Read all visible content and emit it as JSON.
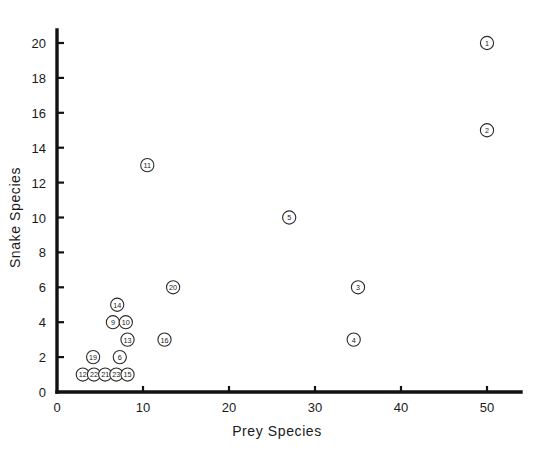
{
  "chart_data": {
    "type": "scatter",
    "title": "",
    "xlabel": "Prey Species",
    "ylabel": "Snake Species",
    "xlim": [
      0,
      55
    ],
    "ylim": [
      0,
      21
    ],
    "xticks": [
      0,
      10,
      20,
      30,
      40,
      50
    ],
    "yticks": [
      0,
      2,
      4,
      6,
      8,
      10,
      12,
      14,
      16,
      18,
      20
    ],
    "grid": false,
    "legend": "none",
    "marker": "open-circle-with-number",
    "points": [
      {
        "label": "1",
        "x": 50.0,
        "y": 20.0
      },
      {
        "label": "2",
        "x": 50.0,
        "y": 15.0
      },
      {
        "label": "11",
        "x": 10.5,
        "y": 13.0
      },
      {
        "label": "5",
        "x": 27.0,
        "y": 10.0
      },
      {
        "label": "20",
        "x": 13.5,
        "y": 6.0
      },
      {
        "label": "3",
        "x": 35.0,
        "y": 6.0
      },
      {
        "label": "14",
        "x": 7.0,
        "y": 5.0
      },
      {
        "label": "9",
        "x": 6.5,
        "y": 4.0
      },
      {
        "label": "10",
        "x": 8.0,
        "y": 4.0
      },
      {
        "label": "13",
        "x": 8.2,
        "y": 3.0
      },
      {
        "label": "16",
        "x": 12.5,
        "y": 3.0
      },
      {
        "label": "4",
        "x": 34.5,
        "y": 3.0
      },
      {
        "label": "19",
        "x": 4.2,
        "y": 2.0
      },
      {
        "label": "6",
        "x": 7.3,
        "y": 2.0
      },
      {
        "label": "12",
        "x": 3.0,
        "y": 1.0
      },
      {
        "label": "22",
        "x": 4.3,
        "y": 1.0
      },
      {
        "label": "21",
        "x": 5.6,
        "y": 1.0
      },
      {
        "label": "23",
        "x": 6.9,
        "y": 1.0
      },
      {
        "label": "15",
        "x": 8.2,
        "y": 1.0
      }
    ]
  },
  "colors": {
    "background": "#ffffff",
    "axis": "#111111",
    "marker_stroke": "#2a2a2a",
    "marker_fill": "#ffffff",
    "text": "#1a1a1a"
  }
}
